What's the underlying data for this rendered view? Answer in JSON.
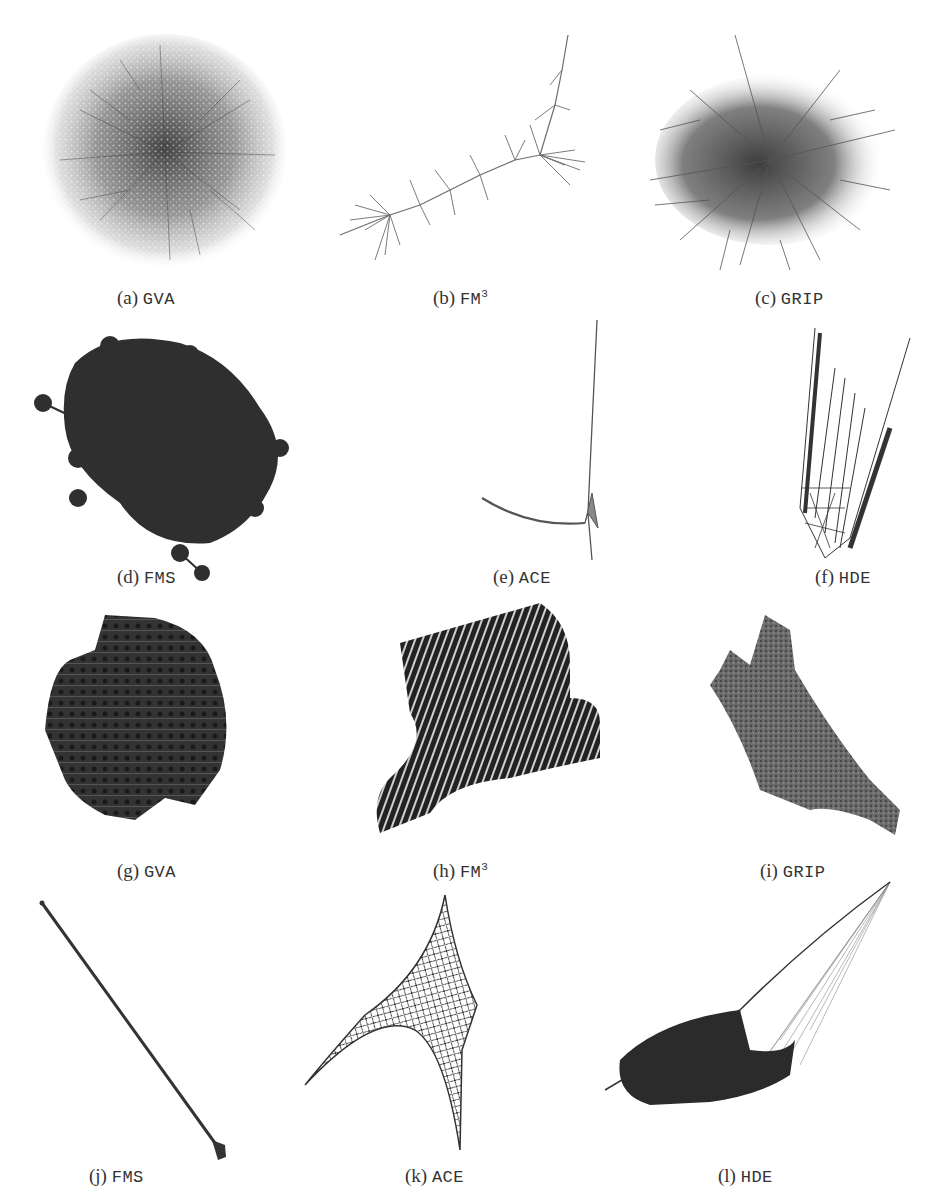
{
  "figure": {
    "panels": [
      {
        "id": "a",
        "label": "(a)",
        "method": "GVA",
        "sup": ""
      },
      {
        "id": "b",
        "label": "(b)",
        "method": "FM",
        "sup": "3"
      },
      {
        "id": "c",
        "label": "(c)",
        "method": "GRIP",
        "sup": ""
      },
      {
        "id": "d",
        "label": "(d)",
        "method": "FMS",
        "sup": ""
      },
      {
        "id": "e",
        "label": "(e)",
        "method": "ACE",
        "sup": ""
      },
      {
        "id": "f",
        "label": "(f)",
        "method": "HDE",
        "sup": ""
      },
      {
        "id": "g",
        "label": "(g)",
        "method": "GVA",
        "sup": ""
      },
      {
        "id": "h",
        "label": "(h)",
        "method": "FM",
        "sup": "3"
      },
      {
        "id": "i",
        "label": "(i)",
        "method": "GRIP",
        "sup": ""
      },
      {
        "id": "j",
        "label": "(j)",
        "method": "FMS",
        "sup": ""
      },
      {
        "id": "k",
        "label": "(k)",
        "method": "ACE",
        "sup": ""
      },
      {
        "id": "l",
        "label": "(l)",
        "method": "HDE",
        "sup": ""
      }
    ]
  },
  "colors": {
    "ink": "#2b2b2b",
    "mid": "#555555",
    "light": "#9a9a9a",
    "background": "#ffffff"
  }
}
